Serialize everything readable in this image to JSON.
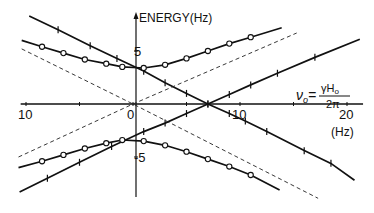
{
  "chart_data": {
    "type": "line",
    "title": "",
    "xlabel": "(Hz)",
    "ylabel": "ENERGY(Hz)",
    "xlim": [
      -10.5,
      21.5
    ],
    "ylim": [
      -9,
      8.5
    ],
    "x_ticks": [
      -10,
      -5,
      0,
      5,
      10,
      15,
      20
    ],
    "x_tick_labels": [
      {
        "x": -10,
        "label": "10"
      },
      {
        "x": 0,
        "label": "0"
      },
      {
        "x": 10,
        "label": "10"
      },
      {
        "x": 20,
        "label": "20"
      }
    ],
    "y_ticks": [
      -5,
      5
    ],
    "y_tick_labels": [
      {
        "y": 5,
        "label": "5"
      },
      {
        "y": -5,
        "label": "-5"
      }
    ],
    "annotation": {
      "lhs": "ν",
      "lhs_sub": "o",
      "equals": "=",
      "numerator": "γH",
      "numerator_sub": "o",
      "denominator": "2π"
    },
    "grid": false,
    "series": [
      {
        "name": "upper-decreasing",
        "style": "solid-cross",
        "x": [
          -9.7,
          -7.0,
          -4.0,
          -1.5,
          1.0,
          3.0,
          5.0,
          7.0,
          9.0,
          10.5,
          12.5,
          16.0,
          18.5,
          20.7
        ],
        "y": [
          8.3,
          7.0,
          5.5,
          4.3,
          3.1,
          2.0,
          1.0,
          0.0,
          -0.9,
          -1.6,
          -2.6,
          -4.4,
          -5.6,
          -7.2
        ]
      },
      {
        "name": "lower-increasing",
        "style": "solid-cross",
        "x": [
          -10.6,
          -8.0,
          -5.0,
          -2.0,
          1.0,
          3.0,
          5.0,
          7.0,
          9.0,
          11.0,
          13.5,
          17.0,
          21.2
        ],
        "y": [
          -8.3,
          -7.0,
          -5.5,
          -4.0,
          -2.6,
          -1.8,
          -0.9,
          0.0,
          0.9,
          1.8,
          2.9,
          4.4,
          6.1
        ]
      },
      {
        "name": "upper-hyperbola",
        "style": "solid-circle",
        "x": [
          -10.4,
          -8.5,
          -6.5,
          -4.5,
          -2.5,
          -1.0,
          1.0,
          3.0,
          5.0,
          7.0,
          9.0,
          11.0,
          13.9
        ],
        "y": [
          6.0,
          5.4,
          4.8,
          4.2,
          3.8,
          3.5,
          3.4,
          3.7,
          4.3,
          5.0,
          5.7,
          6.3,
          7.2
        ]
      },
      {
        "name": "lower-hyperbola",
        "style": "solid-circle",
        "x": [
          -10.7,
          -8.5,
          -6.5,
          -4.5,
          -2.5,
          -1.0,
          1.0,
          3.0,
          5.0,
          7.0,
          9.0,
          11.0,
          13.7
        ],
        "y": [
          -6.0,
          -5.4,
          -4.8,
          -4.2,
          -3.7,
          -3.4,
          -3.5,
          -3.9,
          -4.5,
          -5.2,
          -5.9,
          -6.7,
          -8.1
        ]
      },
      {
        "name": "asymptote-negative-slope",
        "style": "dashed",
        "x": [
          -10.4,
          0,
          17.3
        ],
        "y": [
          5.2,
          0,
          -8.9
        ]
      },
      {
        "name": "asymptote-positive-slope",
        "style": "dashed",
        "x": [
          -10.7,
          0,
          15.3
        ],
        "y": [
          -5.0,
          0,
          6.7
        ]
      }
    ]
  }
}
